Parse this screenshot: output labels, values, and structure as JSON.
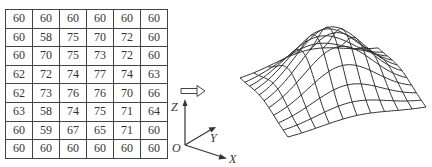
{
  "grid": {
    "rows": [
      [
        60,
        60,
        60,
        60,
        60,
        60
      ],
      [
        60,
        58,
        75,
        70,
        72,
        60
      ],
      [
        60,
        70,
        75,
        73,
        72,
        60
      ],
      [
        62,
        72,
        74,
        77,
        74,
        63
      ],
      [
        62,
        73,
        76,
        76,
        70,
        66
      ],
      [
        63,
        58,
        74,
        75,
        71,
        64
      ],
      [
        60,
        59,
        67,
        65,
        71,
        60
      ],
      [
        60,
        60,
        60,
        60,
        60,
        60
      ]
    ]
  },
  "arrow_icon": "double-arrow-right",
  "axes": {
    "z_label": "Z",
    "y_label": "Y",
    "x_label": "X",
    "origin_label": "O"
  },
  "surface": {
    "type": "wireframe-3d-mesh",
    "description": "3D surface rendering of grid heights"
  }
}
